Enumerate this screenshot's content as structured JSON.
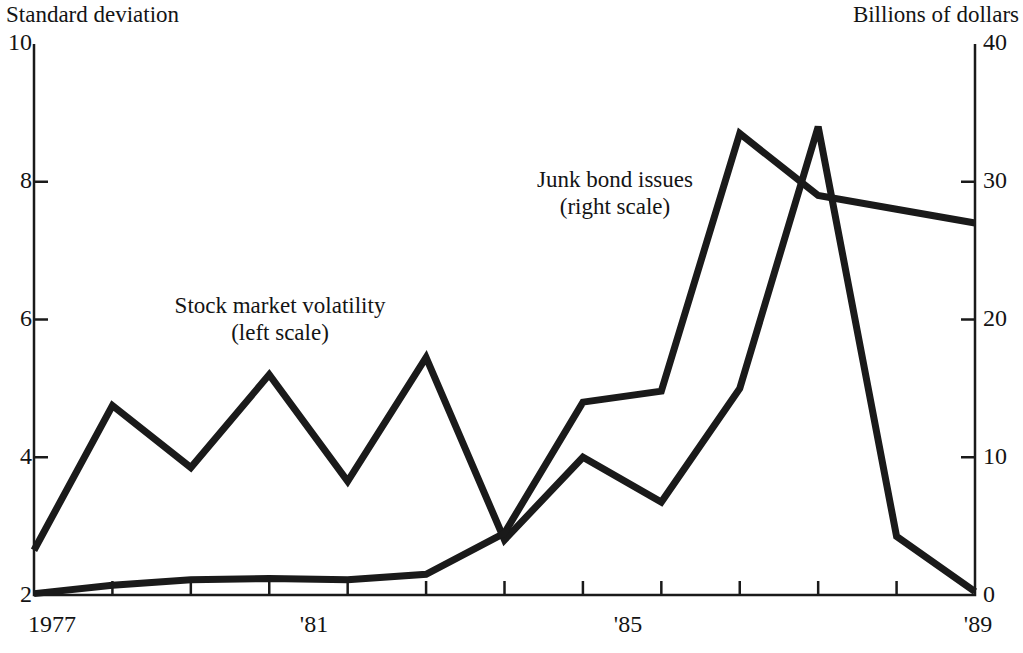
{
  "chart_data": {
    "type": "line",
    "title": "",
    "x": [
      1977,
      1978,
      1979,
      1980,
      1981,
      1982,
      1983,
      1984,
      1985,
      1986,
      1987,
      1988,
      1989
    ],
    "xlabel": "",
    "xtick_values": [
      1977,
      1981,
      1985,
      1989
    ],
    "xtick_labels": [
      "1977",
      "'81",
      "'85",
      "'89"
    ],
    "xlim": [
      1977,
      1989
    ],
    "grid": false,
    "legend_position": "inside-annotations",
    "left_axis": {
      "label": "Standard deviation",
      "ylim": [
        2,
        10
      ],
      "ticks": [
        2,
        4,
        6,
        8,
        10
      ],
      "tick_labels": [
        "2",
        "4",
        "6",
        "8",
        "10"
      ]
    },
    "right_axis": {
      "label": "Billions of dollars",
      "ylim": [
        0,
        40
      ],
      "ticks": [
        0,
        10,
        20,
        30,
        40
      ],
      "tick_labels": [
        "0",
        "10",
        "20",
        "30",
        "40"
      ]
    },
    "series": [
      {
        "name": "Stock market volatility",
        "scale": "left",
        "annotation": "Stock market volatility",
        "annotation_sub": "(left scale)",
        "color": "#1a1a1a",
        "values": [
          2.65,
          4.75,
          3.85,
          5.2,
          3.65,
          5.45,
          2.8,
          4.0,
          3.35,
          5.0,
          8.8,
          2.85,
          2.05
        ]
      },
      {
        "name": "Junk bond issues",
        "scale": "right",
        "annotation": "Junk bond issues",
        "annotation_sub": "(right scale)",
        "color": "#1a1a1a",
        "values": [
          0.1,
          0.7,
          1.1,
          1.2,
          1.1,
          1.5,
          4.5,
          14.0,
          14.8,
          33.5,
          29.0,
          28.0,
          27.0
        ]
      }
    ]
  }
}
